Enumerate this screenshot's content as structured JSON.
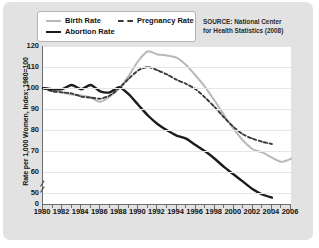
{
  "legend": {
    "items": [
      {
        "label": "Birth Rate",
        "style": "solid-light",
        "color": "#b9b9b9"
      },
      {
        "label": "Abortion Rate",
        "style": "solid-dark",
        "color": "#1c1c1c"
      },
      {
        "label": "Pregnancy Rate",
        "style": "dashed",
        "color": "#3a3a3a"
      }
    ]
  },
  "source": {
    "line1": "SOURCE: National Center",
    "line2": "for Health Statistics (2008)"
  },
  "chart_data": {
    "type": "line",
    "title": "",
    "xlabel": "",
    "ylabel": "Rate per 1,000 Women, Index: 1980=100",
    "xlim": [
      1980,
      2006
    ],
    "ylim": [
      45,
      120
    ],
    "yticks": [
      0,
      50,
      60,
      70,
      80,
      90,
      100,
      110,
      120
    ],
    "ytick_labels": [
      "0",
      "50",
      "60",
      "70",
      "80",
      "90",
      "100",
      "110",
      "120"
    ],
    "axis_break": true,
    "axis_break_between": [
      0,
      50
    ],
    "xticks": [
      1980,
      1982,
      1984,
      1986,
      1988,
      1990,
      1992,
      1994,
      1996,
      1998,
      2000,
      2002,
      2004,
      2006
    ],
    "xtick_labels": [
      "1980",
      "1982",
      "1984",
      "1986",
      "1988",
      "1990",
      "1992",
      "1994",
      "1996",
      "1998",
      "2000",
      "2002",
      "2004",
      "2006"
    ],
    "minor_xticks_every": 1,
    "grid": true,
    "grid_axis": "y",
    "legend_position": "top-left",
    "x": [
      1980,
      1981,
      1982,
      1983,
      1984,
      1985,
      1986,
      1987,
      1988,
      1989,
      1990,
      1991,
      1992,
      1993,
      1994,
      1995,
      1996,
      1997,
      1998,
      1999,
      2000,
      2001,
      2002,
      2003,
      2004,
      2005,
      2006
    ],
    "series": [
      {
        "name": "Birth Rate",
        "color": "#b9b9b9",
        "style": "solid",
        "values": [
          100,
          99,
          98,
          97,
          96.5,
          95.5,
          93.5,
          96,
          100,
          106,
          113,
          117.5,
          116,
          115.5,
          114.5,
          111,
          106,
          100.5,
          94,
          87,
          80.5,
          75,
          71,
          69.5,
          67,
          65,
          66.5
        ]
      },
      {
        "name": "Abortion Rate",
        "color": "#1c1c1c",
        "style": "solid",
        "values": [
          100,
          99.5,
          99.5,
          101.5,
          99.5,
          101.5,
          98.5,
          98,
          100.5,
          97,
          92,
          87,
          83,
          80,
          77.5,
          76,
          73,
          70,
          66.5,
          62.5,
          59,
          55.5,
          52,
          49.5,
          48,
          null,
          null
        ]
      },
      {
        "name": "Pregnancy Rate",
        "color": "#3a3a3a",
        "style": "dashed",
        "values": [
          100,
          98.5,
          98,
          97.5,
          96,
          95.5,
          95,
          96.5,
          100,
          104.5,
          108.5,
          110,
          108.5,
          106.5,
          104,
          102,
          99.5,
          95.5,
          91,
          86,
          81.5,
          78,
          76,
          74.5,
          73.5,
          null,
          null
        ]
      }
    ]
  }
}
